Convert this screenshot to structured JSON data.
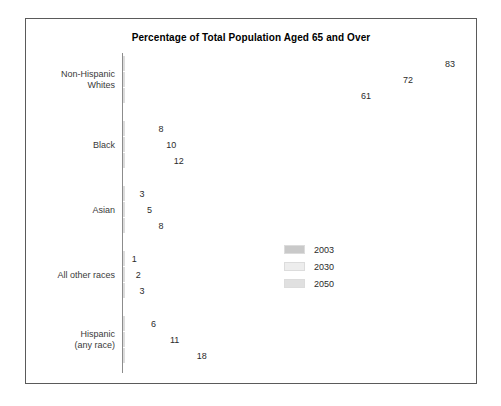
{
  "chart_data": {
    "type": "bar",
    "orientation": "horizontal",
    "title": "Percentage of Total Population Aged 65 and Over",
    "xlabel": "",
    "ylabel": "",
    "xlim": [
      0,
      100
    ],
    "grid": false,
    "legend_position": "center-right",
    "categories": [
      "Non-Hispanic\nWhites",
      "Black",
      "Asian",
      "All other races",
      "Hispanic\n(any race)"
    ],
    "series": [
      {
        "name": "2003",
        "color": "#c9c9c9",
        "values": [
          83,
          8,
          3,
          1,
          6
        ]
      },
      {
        "name": "2030",
        "color": "#ededed",
        "values": [
          72,
          10,
          5,
          2,
          11
        ]
      },
      {
        "name": "2050",
        "color": "#e0e0e0",
        "values": [
          61,
          12,
          8,
          3,
          18
        ]
      }
    ]
  },
  "categories": [
    {
      "line1": "Non-Hispanic",
      "line2": "Whites"
    },
    {
      "line1": "Black",
      "line2": ""
    },
    {
      "line1": "Asian",
      "line2": ""
    },
    {
      "line1": "All other races",
      "line2": ""
    },
    {
      "line1": "Hispanic",
      "line2": "(any race)"
    }
  ],
  "legend": [
    {
      "label": "2003",
      "color": "#c9c9c9"
    },
    {
      "label": "2030",
      "color": "#ededed"
    },
    {
      "label": "2050",
      "color": "#e0e0e0"
    }
  ],
  "colors": {
    "frame_border": "#5a5a5a",
    "axis_line": "#8c8c8c",
    "title_text": "#000000",
    "label_text": "#3a3a3a",
    "value_text": "#2b2b2b",
    "background": "#ffffff"
  }
}
